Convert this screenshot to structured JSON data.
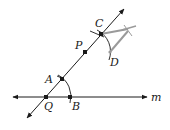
{
  "diagram": {
    "type": "geometric-construction",
    "line_label": "m",
    "points": [
      {
        "id": "Q",
        "label": "Q",
        "x": 46,
        "y": 97
      },
      {
        "id": "B",
        "label": "B",
        "x": 70,
        "y": 97
      },
      {
        "id": "A",
        "label": "A",
        "x": 62,
        "y": 79
      },
      {
        "id": "P",
        "label": "P",
        "x": 85,
        "y": 52
      },
      {
        "id": "C",
        "label": "C",
        "x": 101,
        "y": 34
      },
      {
        "id": "D",
        "label": "D",
        "x": 110,
        "y": 52
      }
    ],
    "colors": {
      "ink": "#1a1a1a",
      "compass": "#9a9a9a"
    }
  }
}
